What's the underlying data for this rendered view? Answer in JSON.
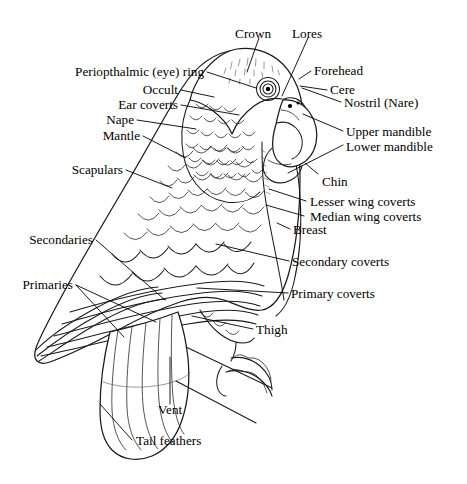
{
  "figure": {
    "background_color": "#ffffff",
    "line_color": "#1a1a1a",
    "text_color": "#000000"
  },
  "labels": {
    "crown": "Crown",
    "lores": "Lores",
    "periopthalmic_ring": "Periopthalmic (eye) ring",
    "forehead": "Forehead",
    "occult": "Occult",
    "cere": "Cere",
    "ear_coverts": "Ear coverts",
    "nostril": "Nostril (Nare)",
    "nape": "Nape",
    "mantle": "Mantle",
    "upper_mandible": "Upper mandible",
    "lower_mandible": "Lower mandible",
    "scapulars": "Scapulars",
    "chin": "Chin",
    "lesser_wing_coverts": "Lesser wing coverts",
    "median_wing_coverts": "Median wing coverts",
    "breast": "Breast",
    "secondaries": "Secondaries",
    "secondary_coverts": "Secondary coverts",
    "primaries": "Primaries",
    "primary_coverts": "Primary coverts",
    "thigh": "Thigh",
    "vent": "Vent",
    "tail_feathers": "Tail feathers"
  }
}
